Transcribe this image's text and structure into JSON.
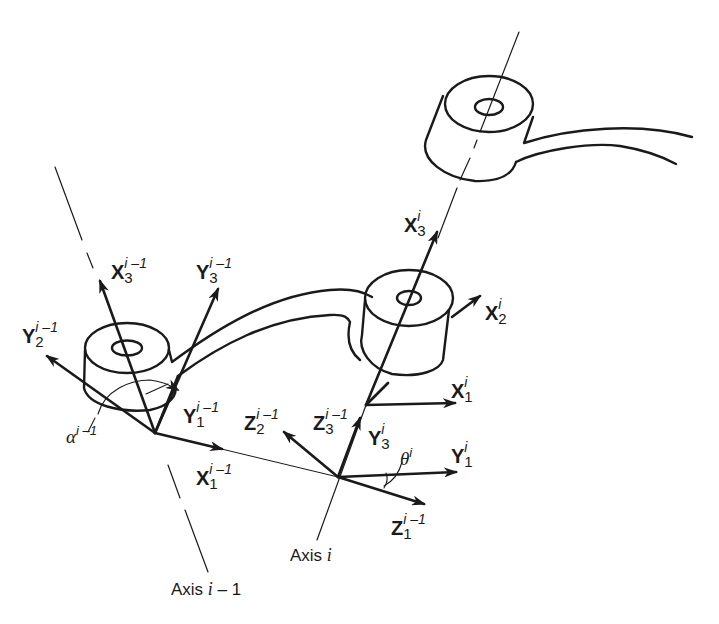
{
  "diagram": {
    "type": "Denavit-Hartenberg link frames (two consecutive robot joint axes)",
    "stroke_color": "#1a1a1a",
    "background": "#ffffff",
    "axes": [
      {
        "id": "axis_i_minus_1",
        "label_main": "Axis ",
        "label_var": "i",
        "label_suffix": " – 1"
      },
      {
        "id": "axis_i",
        "label_main": "Axis ",
        "label_var": "i",
        "label_suffix": ""
      }
    ],
    "frame_labels": {
      "X3_im1": {
        "letter": "X",
        "sub": "3",
        "sup": "i –1"
      },
      "Y3_im1": {
        "letter": "Y",
        "sub": "3",
        "sup": "i –1"
      },
      "Y2_im1": {
        "letter": "Y",
        "sub": "2",
        "sup": "i –1"
      },
      "Y1_im1": {
        "letter": "Y",
        "sub": "1",
        "sup": "i –1"
      },
      "X1_im1": {
        "letter": "X",
        "sub": "1",
        "sup": "i –1"
      },
      "Z2_im1": {
        "letter": "Z",
        "sub": "2",
        "sup": "i –1"
      },
      "Z3_im1": {
        "letter": "Z",
        "sub": "3",
        "sup": "i –1"
      },
      "Z1_im1": {
        "letter": "Z",
        "sub": "1",
        "sup": "i –1"
      },
      "X3_i": {
        "letter": "X",
        "sub": "3",
        "sup": "i"
      },
      "X2_i": {
        "letter": "X",
        "sub": "2",
        "sup": "i"
      },
      "X1_i": {
        "letter": "X",
        "sub": "1",
        "sup": "i"
      },
      "Y3_i": {
        "letter": "Y",
        "sub": "3",
        "sup": "i"
      },
      "Y1_i": {
        "letter": "Y",
        "sub": "1",
        "sup": "i"
      }
    },
    "angles": {
      "alpha": {
        "symbol": "α",
        "sup": "i –1"
      },
      "theta": {
        "symbol": "θ",
        "sup": "i"
      }
    }
  }
}
